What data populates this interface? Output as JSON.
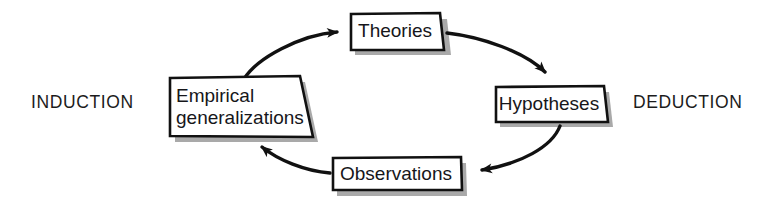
{
  "diagram": {
    "type": "cycle-diagram",
    "background_color": "#ffffff",
    "stroke_color": "#111111",
    "shadow_color": "#a8a8a8",
    "text_color": "#16161a",
    "side_labels": [
      {
        "id": "induction",
        "label": "INDUCTION",
        "side": "left"
      },
      {
        "id": "deduction",
        "label": "DEDUCTION",
        "side": "right"
      }
    ],
    "nodes": [
      {
        "id": "theories",
        "label": "Theories",
        "position": "top"
      },
      {
        "id": "hypotheses",
        "label": "Hypotheses",
        "position": "right"
      },
      {
        "id": "observations",
        "label": "Observations",
        "position": "bottom"
      },
      {
        "id": "empirical_generalizations",
        "label": "Empirical\ngeneralizations",
        "position": "left"
      }
    ],
    "arrows": [
      {
        "id": "arrow-empirical-to-theories",
        "from": "empirical_generalizations",
        "to": "theories",
        "direction": "clockwise"
      },
      {
        "id": "arrow-theories-to-hypotheses",
        "from": "theories",
        "to": "hypotheses",
        "direction": "clockwise"
      },
      {
        "id": "arrow-hypotheses-to-observations",
        "from": "hypotheses",
        "to": "observations",
        "direction": "clockwise"
      },
      {
        "id": "arrow-observations-to-empirical",
        "from": "observations",
        "to": "empirical_generalizations",
        "direction": "clockwise"
      }
    ]
  }
}
